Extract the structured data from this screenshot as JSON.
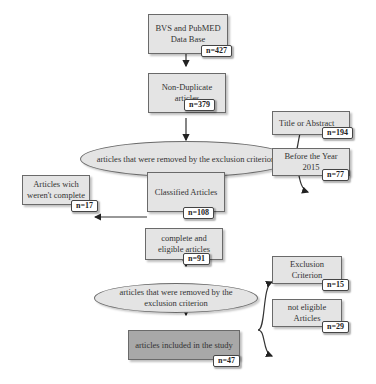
{
  "diagram": {
    "type": "flowchart",
    "nodes": {
      "database": {
        "label": "BVS and PubMED Data Base",
        "count": "n=427"
      },
      "non_duplicate": {
        "label": "Non-Duplicate articles",
        "count": "n=379"
      },
      "exclusion_1": {
        "label": "articles that were removed by the exclusion criterion"
      },
      "title_abstract": {
        "label": "Title or Abstract",
        "count": "n=194"
      },
      "before_year": {
        "label": "Before   the Year 2015",
        "count": "n=77"
      },
      "classified": {
        "label": "Classified Articles",
        "count": "n=108"
      },
      "incomplete": {
        "label": "Articles wich weren't complete",
        "count": "n=17"
      },
      "complete_eligible": {
        "label": "complete and eligible articles",
        "count": "n=91"
      },
      "exclusion_2": {
        "label": "articles that were removed by the exclusion criterion"
      },
      "exclusion_criterion": {
        "label": "Exclusion Criterion",
        "count": "n=15"
      },
      "not_eligible": {
        "label": "not eligible Articles",
        "count": "n=29"
      },
      "included": {
        "label": "articles included in the study",
        "count": "n=47"
      }
    },
    "edges": [
      [
        "database",
        "non_duplicate"
      ],
      [
        "non_duplicate",
        "exclusion_1"
      ],
      [
        "exclusion_1",
        "title_abstract"
      ],
      [
        "exclusion_1",
        "before_year"
      ],
      [
        "exclusion_1",
        "classified"
      ],
      [
        "classified",
        "incomplete"
      ],
      [
        "classified",
        "complete_eligible"
      ],
      [
        "complete_eligible",
        "exclusion_2"
      ],
      [
        "exclusion_2",
        "exclusion_criterion"
      ],
      [
        "exclusion_2",
        "not_eligible"
      ],
      [
        "exclusion_2",
        "included"
      ]
    ]
  }
}
